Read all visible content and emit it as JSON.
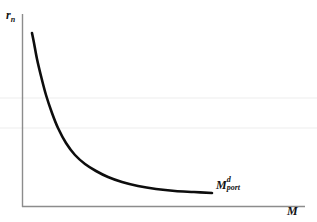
{
  "figure": {
    "background_color": "#ffffff",
    "width": 317,
    "height": 222
  },
  "labels": {
    "y_axis_main": "r",
    "y_axis_sub": "n",
    "x_axis_main": "M",
    "curve_main": "M",
    "curve_sup": "d",
    "curve_sub": "port"
  },
  "style": {
    "axis_color": "#8c8c8c",
    "curve_color": "#0d0d0d",
    "text_color": "#111111",
    "artifact_line_color": "#f3f3f3"
  },
  "chart_data": {
    "type": "line",
    "title": "",
    "xlabel": "M",
    "ylabel": "r_n",
    "grid": false,
    "legend": "none",
    "axis_origin_px": [
      22,
      207
    ],
    "axis_x_end_px": [
      305,
      207
    ],
    "axis_y_end_px": [
      22,
      14
    ],
    "xlim": [
      0,
      1
    ],
    "ylim": [
      0,
      1
    ],
    "annotations": [
      {
        "text": "M^d_port",
        "meaning": "portfolio money demand curve",
        "position_px": [
          216,
          185
        ]
      }
    ],
    "series": [
      {
        "name": "M^d_port",
        "description": "Downward sloping convex money demand curve; nominal interest rate r_n falls as money quantity M rises, flattening toward the horizontal axis",
        "color": "#0d0d0d",
        "linewidth": 2.6,
        "points_px": [
          [
            32,
            33
          ],
          [
            34,
            43
          ],
          [
            37,
            59
          ],
          [
            41,
            76
          ],
          [
            46,
            95
          ],
          [
            52,
            113
          ],
          [
            58,
            128
          ],
          [
            66,
            143
          ],
          [
            75,
            155
          ],
          [
            85,
            164
          ],
          [
            96,
            171
          ],
          [
            108,
            177
          ],
          [
            122,
            182
          ],
          [
            138,
            186
          ],
          [
            156,
            189
          ],
          [
            175,
            191
          ],
          [
            194,
            192
          ],
          [
            212,
            193
          ]
        ],
        "normalized_points": [
          [
            0.035,
            0.901
          ],
          [
            0.042,
            0.849
          ],
          [
            0.053,
            0.767
          ],
          [
            0.067,
            0.679
          ],
          [
            0.085,
            0.58
          ],
          [
            0.106,
            0.487
          ],
          [
            0.127,
            0.409
          ],
          [
            0.155,
            0.332
          ],
          [
            0.187,
            0.269
          ],
          [
            0.223,
            0.223
          ],
          [
            0.261,
            0.186
          ],
          [
            0.304,
            0.155
          ],
          [
            0.353,
            0.129
          ],
          [
            0.41,
            0.109
          ],
          [
            0.474,
            0.093
          ],
          [
            0.541,
            0.083
          ],
          [
            0.608,
            0.078
          ],
          [
            0.671,
            0.072
          ]
        ]
      }
    ],
    "artifact_lines_px": [
      {
        "y": 98,
        "x_start": 0,
        "x_end": 317
      },
      {
        "y": 128,
        "x_start": 0,
        "x_end": 317
      }
    ]
  }
}
